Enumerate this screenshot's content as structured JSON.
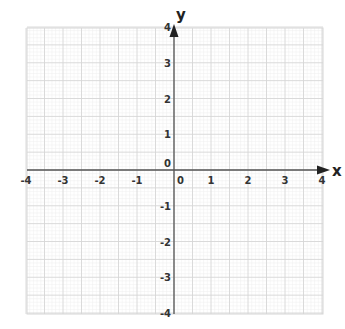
{
  "chart_data": {
    "type": "scatter",
    "title": "",
    "xlabel": "x",
    "ylabel": "y",
    "xlim": [
      -4,
      4
    ],
    "ylim": [
      -4,
      4
    ],
    "x_ticks": [
      -4,
      -3,
      -2,
      -1,
      0,
      1,
      2,
      3,
      4
    ],
    "y_ticks": [
      -4,
      -3,
      -2,
      -1,
      0,
      1,
      2,
      3,
      4
    ],
    "x_tick_labels": [
      "-4",
      "-3",
      "-2",
      "-1",
      "0",
      "1",
      "2",
      "3",
      "4"
    ],
    "y_tick_labels": [
      "-4",
      "-3",
      "-2",
      "-1",
      "0",
      "1",
      "2",
      "3",
      "4"
    ],
    "grid": true,
    "grid_major_step": 0.5,
    "grid_minor_step": 0.1,
    "series": []
  },
  "axes": {
    "x_label": "x",
    "y_label": "y",
    "x_origin_label": "0",
    "y_origin_label": "0"
  },
  "colors": {
    "axis": "#555555",
    "grid_major": "#d6d6d6",
    "grid_minor": "#efefef",
    "text": "#333333"
  }
}
